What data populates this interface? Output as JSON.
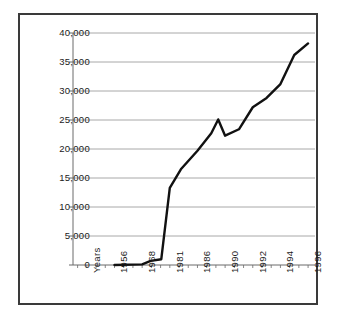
{
  "chart_data": {
    "type": "line",
    "title": "",
    "subtitle": "",
    "xlabel": "Years",
    "ylabel": "",
    "grid": "horizontal",
    "legend": "none",
    "ylim": [
      0,
      40000
    ],
    "ytick_labels": [
      "0",
      "5,000",
      "10,000",
      "15,000",
      "20,000",
      "25,000",
      "30,000",
      "35,000",
      "40,000"
    ],
    "ytick_values": [
      0,
      5000,
      10000,
      15000,
      20000,
      25000,
      30000,
      35000,
      40000
    ],
    "xtick_labels": [
      "Years",
      "1956",
      "1968",
      "1981",
      "1986",
      "1990",
      "1992",
      "1994",
      "1996"
    ],
    "x_axis_note": "Irregularly spaced year categories along a uniform category axis",
    "series": [
      {
        "name": "Value",
        "color": "#111111",
        "line_width": 2.4,
        "points": [
          {
            "x": 1956,
            "y": 0
          },
          {
            "x": 1968,
            "y": 100
          },
          {
            "x": 1972,
            "y": 700
          },
          {
            "x": 1977,
            "y": 1000
          },
          {
            "x": 1981,
            "y": 13300
          },
          {
            "x": 1983,
            "y": 16500
          },
          {
            "x": 1986,
            "y": 19700
          },
          {
            "x": 1987,
            "y": 21200
          },
          {
            "x": 1988,
            "y": 22700
          },
          {
            "x": 1989,
            "y": 25100
          },
          {
            "x": 1990,
            "y": 22300
          },
          {
            "x": 1991,
            "y": 23400
          },
          {
            "x": 1992,
            "y": 27200
          },
          {
            "x": 1993,
            "y": 28800
          },
          {
            "x": 1994,
            "y": 31200
          },
          {
            "x": 1995,
            "y": 36200
          },
          {
            "x": 1996,
            "y": 38200
          }
        ]
      }
    ]
  },
  "axis": {
    "x_label_text": "Years",
    "gridline_color": "#a8a8a8",
    "axis_color": "#6a6a6a",
    "frame_color": "#3a3a3a",
    "text_color": "#1b1b1b"
  }
}
